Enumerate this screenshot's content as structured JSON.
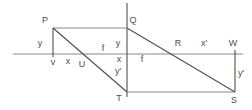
{
  "figure": {
    "background_color": "#ffffff",
    "label_color": "#4d4d4d",
    "stroke_dark": "#4f4f4f",
    "stroke_light": "#8a8a8a",
    "lines": [
      {
        "name": "principal-axis",
        "x1": 13,
        "y1": 54,
        "x2": 243,
        "y2": 54,
        "tone": "light"
      },
      {
        "name": "lens-vertical-line",
        "x1": 127,
        "y1": 3,
        "x2": 127,
        "y2": 97,
        "tone": "dark"
      },
      {
        "name": "object-height-P-v",
        "x1": 53,
        "y1": 28,
        "x2": 53,
        "y2": 57,
        "tone": "dark"
      },
      {
        "name": "top-segment-P-Q",
        "x1": 53,
        "y1": 28,
        "x2": 127,
        "y2": 28,
        "tone": "light"
      },
      {
        "name": "ray-P-U-T",
        "x1": 53,
        "y1": 28,
        "x2": 127,
        "y2": 92,
        "tone": "dark"
      },
      {
        "name": "bottom-segment-T-S",
        "x1": 127,
        "y1": 92,
        "x2": 235,
        "y2": 92,
        "tone": "light"
      },
      {
        "name": "ray-Q-R-S",
        "x1": 127,
        "y1": 28,
        "x2": 235,
        "y2": 92,
        "tone": "dark"
      },
      {
        "name": "image-height-W-S",
        "x1": 235,
        "y1": 50,
        "x2": 235,
        "y2": 92,
        "tone": "dark"
      }
    ],
    "labels": [
      {
        "name": "point-label-P",
        "text": "P",
        "x": 45,
        "y": 23
      },
      {
        "name": "segment-label-y-object",
        "text": "y",
        "x": 40,
        "y": 46
      },
      {
        "name": "point-label-v",
        "text": "v",
        "x": 53,
        "y": 65
      },
      {
        "name": "segment-label-x-object",
        "text": "x",
        "x": 68,
        "y": 64
      },
      {
        "name": "point-label-U",
        "text": "U",
        "x": 82,
        "y": 67
      },
      {
        "name": "segment-label-f-left",
        "text": "f",
        "x": 103,
        "y": 51
      },
      {
        "name": "segment-label-y-lens",
        "text": "y",
        "x": 118,
        "y": 46
      },
      {
        "name": "point-label-Q",
        "text": "Q",
        "x": 133,
        "y": 23
      },
      {
        "name": "segment-label-x-lens",
        "text": "x",
        "x": 119,
        "y": 62
      },
      {
        "name": "segment-label-f-right",
        "text": "f",
        "x": 142,
        "y": 62
      },
      {
        "name": "segment-label-y-prime-lens",
        "text": "y'",
        "x": 118,
        "y": 74
      },
      {
        "name": "point-label-R",
        "text": "R",
        "x": 178,
        "y": 46
      },
      {
        "name": "segment-label-x-prime",
        "text": "x'",
        "x": 204,
        "y": 46
      },
      {
        "name": "point-label-W",
        "text": "W",
        "x": 233,
        "y": 46
      },
      {
        "name": "segment-label-y-prime-image",
        "text": "y'",
        "x": 241,
        "y": 76
      },
      {
        "name": "point-label-T",
        "text": "T",
        "x": 119,
        "y": 101
      },
      {
        "name": "point-label-S",
        "text": "S",
        "x": 234,
        "y": 103
      }
    ]
  }
}
